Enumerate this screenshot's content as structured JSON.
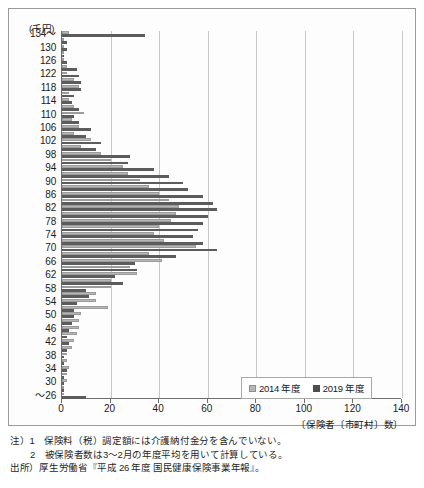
{
  "chart": {
    "units_label": "(千円)",
    "y_axis_top_label": "134～",
    "y_axis_bottom_label": "～26",
    "x_axis_title": "〔保険者〔市町村〕数〕"
  },
  "legend": {
    "items": [
      {
        "label": "2014 年度",
        "color": "#b6b6b6",
        "key": "2014"
      },
      {
        "label": "2019 年度",
        "color": "#4e4e4e",
        "key": "2019"
      }
    ]
  },
  "footnotes": {
    "line1": "注）1　保険料（税）調定額には介護納付金分を含んでいない。",
    "line2": "2　被保険者数は3～2月の年度平均を用いて計算している。",
    "line3": "出所）厚生労働省『平成 26 年度 国民健康保険事業年報』。"
  },
  "chart_data": {
    "type": "bar",
    "orientation": "horizontal",
    "title": "",
    "xlabel": "〔保険者〔市町村〕数〕",
    "ylabel": "(千円)",
    "xlim": [
      0,
      140
    ],
    "ylim_note": "categories descending from 134～ to ～26 in steps of 2 thousand yen",
    "grid": true,
    "legend_position": "bottom-right",
    "xticks": [
      0,
      20,
      40,
      60,
      80,
      100,
      120,
      140
    ],
    "yticks_labeled": [
      "134～",
      "130",
      "126",
      "122",
      "118",
      "114",
      "110",
      "106",
      "102",
      "98",
      "94",
      "90",
      "86",
      "82",
      "78",
      "74",
      "70",
      "66",
      "62",
      "58",
      "54",
      "50",
      "46",
      "42",
      "38",
      "34",
      "30",
      "～26"
    ],
    "categories": [
      "134～",
      "132",
      "130",
      "128",
      "126",
      "124",
      "122",
      "120",
      "118",
      "116",
      "114",
      "112",
      "110",
      "108",
      "106",
      "104",
      "102",
      "100",
      "98",
      "96",
      "94",
      "92",
      "90",
      "88",
      "86",
      "84",
      "82",
      "80",
      "78",
      "76",
      "74",
      "72",
      "70",
      "68",
      "66",
      "64",
      "62",
      "60",
      "58",
      "56",
      "54",
      "52",
      "50",
      "48",
      "46",
      "44",
      "42",
      "40",
      "38",
      "36",
      "34",
      "32",
      "30",
      "28",
      "～26"
    ],
    "series": [
      {
        "name": "2014 年度",
        "color": "#b6b6b6",
        "values": [
          3,
          1,
          1,
          1,
          1,
          2,
          2,
          5,
          7,
          3,
          3,
          5,
          9,
          4,
          7,
          5,
          12,
          8,
          16,
          20,
          25,
          27,
          32,
          36,
          40,
          44,
          48,
          47,
          45,
          40,
          38,
          42,
          55,
          36,
          41,
          28,
          31,
          20,
          20,
          14,
          14,
          19,
          8,
          7,
          7,
          6,
          5,
          4,
          2,
          2,
          3,
          2,
          2,
          1,
          0
        ]
      },
      {
        "name": "2019 年度",
        "color": "#5c5c5c",
        "values": [
          34,
          2,
          2,
          1,
          2,
          6,
          7,
          8,
          8,
          5,
          4,
          7,
          5,
          7,
          12,
          10,
          16,
          14,
          28,
          27,
          38,
          44,
          50,
          52,
          58,
          62,
          64,
          60,
          58,
          56,
          54,
          58,
          64,
          47,
          30,
          31,
          22,
          25,
          10,
          11,
          6,
          5,
          5,
          4,
          3,
          2,
          3,
          2,
          1,
          1,
          2,
          1,
          1,
          1,
          10
        ]
      }
    ]
  }
}
